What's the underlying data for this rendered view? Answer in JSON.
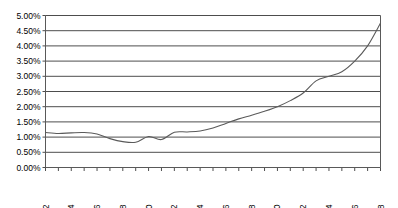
{
  "chart_data": {
    "type": "line",
    "title": "",
    "subtitle": "",
    "xlabel": "",
    "ylabel": "",
    "grid": true,
    "legend": false,
    "legend_position": "none",
    "xlim": [
      1982,
      2008
    ],
    "ylim": [
      0.0,
      5.0
    ],
    "y_tick_values": [
      0.0,
      0.5,
      1.0,
      1.5,
      2.0,
      2.5,
      3.0,
      3.5,
      4.0,
      4.5,
      5.0
    ],
    "y_tick_labels": [
      "0.00%",
      "0.50%",
      "1.00%",
      "1.50%",
      "2.00%",
      "2.50%",
      "3.00%",
      "3.50%",
      "4.00%",
      "4.50%",
      "5.00%"
    ],
    "x_tick_values": [
      1982,
      1983,
      1984,
      1985,
      1986,
      1987,
      1988,
      1989,
      1990,
      1991,
      1992,
      1993,
      1994,
      1995,
      1996,
      1997,
      1998,
      1999,
      2000,
      2001,
      2002,
      2003,
      2004,
      2005,
      2006,
      2007,
      2008
    ],
    "x_tick_labels": [
      "1982",
      "",
      "1984",
      "",
      "1986",
      "",
      "1988",
      "",
      "1990",
      "",
      "1992",
      "",
      "1994",
      "",
      "1996",
      "",
      "1998",
      "",
      "2000",
      "",
      "2002",
      "",
      "2004",
      "",
      "2006",
      "",
      "2008"
    ],
    "x_label_orientation": "vertical",
    "series": [
      {
        "name": "Series 1",
        "color": "#5a5a5a",
        "x": [
          1982,
          1983,
          1984,
          1985,
          1986,
          1987,
          1988,
          1989,
          1990,
          1991,
          1992,
          1993,
          1994,
          1995,
          1996,
          1997,
          1998,
          1999,
          2000,
          2001,
          2002,
          2003,
          2004,
          2005,
          2006,
          2007,
          2008
        ],
        "values": [
          1.15,
          1.12,
          1.14,
          1.15,
          1.1,
          0.95,
          0.85,
          0.83,
          1.02,
          0.92,
          1.16,
          1.17,
          1.2,
          1.3,
          1.45,
          1.6,
          1.72,
          1.85,
          2.0,
          2.2,
          2.45,
          2.85,
          3.0,
          3.15,
          3.5,
          4.0,
          4.75
        ]
      }
    ]
  }
}
